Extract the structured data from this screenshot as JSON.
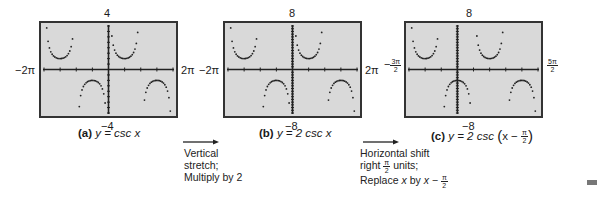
{
  "figure": {
    "panels": [
      {
        "id": "a",
        "letter": "(a)",
        "equation": "y = csc x",
        "ymax": "4",
        "ymin": "−4",
        "xmin": "−2π",
        "xmax": "2π"
      },
      {
        "id": "b",
        "letter": "(b)",
        "equation": "y = 2 csc x",
        "ymax": "8",
        "ymin": "−8",
        "xmin": "−2π",
        "xmax": "2π"
      },
      {
        "id": "c",
        "letter": "(c)",
        "equation_prefix": "y = 2 csc",
        "equation_inner": "x −",
        "equation_frac_num": "π",
        "equation_frac_den": "2",
        "ymax": "8",
        "ymin": "−8",
        "xmin_num": "3π",
        "xmin_den": "2",
        "xmin_sign": "−",
        "xmax_num": "5π",
        "xmax_den": "2"
      }
    ],
    "transitions": [
      {
        "lines": [
          "Vertical",
          "stretch;",
          "Multiply by 2"
        ]
      },
      {
        "line1": "Horizontal shift",
        "line2_a": "right",
        "line2_num": "π",
        "line2_den": "2",
        "line2_b": "units;",
        "line3_a": "Replace",
        "line3_x": "x",
        "line3_by": "by",
        "line3_expr": "x −",
        "line3_num": "π",
        "line3_den": "2"
      }
    ]
  },
  "chart_data": [
    {
      "type": "scatter",
      "title": "(a) y = csc x",
      "xlim": [
        "-2π",
        "2π"
      ],
      "ylim": [
        -4,
        4
      ],
      "function": "csc(x)",
      "grid": false
    },
    {
      "type": "scatter",
      "title": "(b) y = 2 csc x",
      "xlim": [
        "-2π",
        "2π"
      ],
      "ylim": [
        -8,
        8
      ],
      "function": "2*csc(x)",
      "grid": false
    },
    {
      "type": "scatter",
      "title": "(c) y = 2 csc (x − π/2)",
      "xlim": [
        "-3π/2",
        "5π/2"
      ],
      "ylim": [
        -8,
        8
      ],
      "function": "2*csc(x - π/2)",
      "grid": false
    }
  ]
}
